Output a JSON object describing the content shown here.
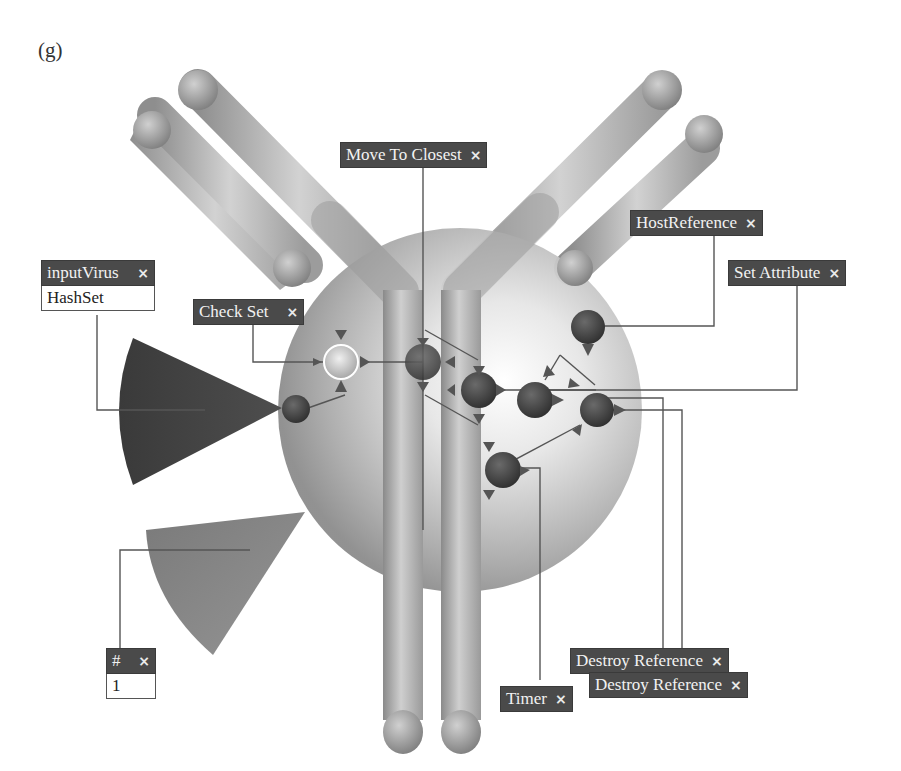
{
  "figure": {
    "panel_label": "(g)"
  },
  "nodes": {
    "move_to_closest": {
      "title": "Move To Closest",
      "close_icon": "×"
    },
    "host_reference": {
      "title": "HostReference",
      "close_icon": "×"
    },
    "set_attribute": {
      "title": "Set Attribute",
      "close_icon": "×"
    },
    "input_virus": {
      "title": "inputVirus",
      "close_icon": "×",
      "value": "HashSet"
    },
    "check_set": {
      "title": "Check Set",
      "close_icon": "×"
    },
    "number": {
      "title": "#",
      "close_icon": "×",
      "value": "1"
    },
    "destroy_reference_1": {
      "title": "Destroy Reference",
      "close_icon": "×"
    },
    "destroy_reference_2": {
      "title": "Destroy Reference",
      "close_icon": "×"
    },
    "timer": {
      "title": "Timer",
      "close_icon": "×"
    }
  },
  "colors": {
    "node_header": "#4a4a4a",
    "node_text": "#f2f2f2",
    "connector": "#555555",
    "background": "#ffffff"
  }
}
